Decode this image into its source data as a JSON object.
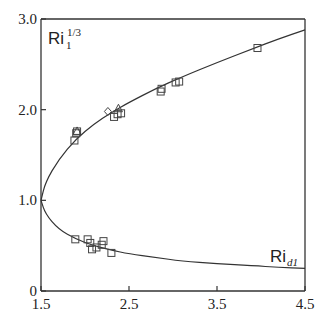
{
  "chart_data": {
    "type": "scatter",
    "title": "",
    "xlabel": "",
    "ylabel": "",
    "xlim": [
      1.5,
      4.5
    ],
    "ylim": [
      0,
      3.0
    ],
    "x_ticks": [
      "1.5",
      "2.5",
      "3.5",
      "4.5"
    ],
    "y_ticks": [
      "0",
      "1.0",
      "2.0",
      "3.0"
    ],
    "grid": false,
    "annotations": [
      {
        "text": "Ri",
        "sub": "1",
        "sup": "1/3",
        "position": "top-left"
      },
      {
        "text": "Ri",
        "sub": "d1",
        "position": "lower-right"
      }
    ],
    "curves": [
      {
        "name": "Ri1^(1/3) (upper branch)",
        "x": [
          1.5,
          1.55,
          1.7,
          1.9,
          2.1,
          2.3,
          2.5,
          2.8,
          3.1,
          3.5,
          3.9,
          4.2,
          4.5
        ],
        "y": [
          1.0,
          1.2,
          1.45,
          1.68,
          1.84,
          1.97,
          2.08,
          2.23,
          2.36,
          2.52,
          2.67,
          2.78,
          2.88
        ]
      },
      {
        "name": "Rid1 (lower branch)",
        "x": [
          1.5,
          1.55,
          1.7,
          1.9,
          2.1,
          2.3,
          2.5,
          2.8,
          3.1,
          3.5,
          3.9,
          4.2,
          4.5
        ],
        "y": [
          1.0,
          0.85,
          0.68,
          0.57,
          0.5,
          0.45,
          0.41,
          0.37,
          0.33,
          0.3,
          0.28,
          0.26,
          0.25
        ]
      }
    ],
    "series": [
      {
        "name": "squares",
        "marker": "square",
        "points": [
          [
            1.88,
            1.66
          ],
          [
            1.9,
            1.74
          ],
          [
            1.91,
            1.76
          ],
          [
            2.33,
            1.92
          ],
          [
            2.37,
            1.95
          ],
          [
            2.41,
            1.96
          ],
          [
            2.86,
            2.2
          ],
          [
            2.87,
            2.23
          ],
          [
            3.03,
            2.3
          ],
          [
            3.07,
            2.31
          ],
          [
            3.96,
            2.68
          ],
          [
            1.89,
            0.57
          ],
          [
            2.03,
            0.57
          ],
          [
            2.06,
            0.53
          ],
          [
            2.08,
            0.46
          ],
          [
            2.13,
            0.48
          ],
          [
            2.19,
            0.51
          ],
          [
            2.21,
            0.55
          ],
          [
            2.3,
            0.42
          ]
        ]
      },
      {
        "name": "diamond",
        "marker": "diamond",
        "points": [
          [
            2.26,
            1.98
          ]
        ]
      },
      {
        "name": "triangles",
        "marker": "triangle",
        "points": [
          [
            2.38,
            2.01
          ],
          [
            1.91,
            1.76
          ]
        ]
      }
    ]
  }
}
